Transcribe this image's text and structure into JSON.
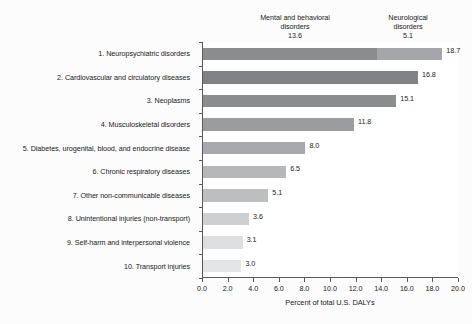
{
  "chart_data": {
    "type": "bar",
    "orientation": "horizontal",
    "title": "",
    "xlabel": "Percent of total U.S. DALYs",
    "ylabel": "",
    "xlim": [
      0.0,
      20.0
    ],
    "xticks": [
      "0.0",
      "2.0",
      "4.0",
      "6.0",
      "8.0",
      "10.0",
      "12.0",
      "14.0",
      "16.0",
      "18.0",
      "20.0"
    ],
    "xtick_values": [
      0,
      2,
      4,
      6,
      8,
      10,
      12,
      14,
      16,
      18,
      20
    ],
    "grid": false,
    "legend": "none",
    "categories": [
      "1. Neuropsychiatric disorders",
      "2. Cardiovascular and circulatory diseases",
      "3. Neoplasms",
      "4. Musculoskeletal disorders",
      "5. Diabetes, urogenital, blood, and endocrine disease",
      "6. Chronic respiratory diseases",
      "7. Other non-communicable diseases",
      "8. Unintentional injuries (non-transport)",
      "9. Self-harm and interpersonal violence",
      "10. Transport injuries"
    ],
    "values": [
      18.7,
      16.8,
      15.1,
      11.8,
      8.0,
      6.5,
      5.1,
      3.6,
      3.1,
      3.0
    ],
    "value_labels": [
      "18.7",
      "16.8",
      "15.1",
      "11.8",
      "8.0",
      "6.5",
      "5.1",
      "3.6",
      "3.1",
      "3.0"
    ],
    "bar_colors": [
      "#939598",
      "#808285",
      "#8a8c8e",
      "#9a9c9e",
      "#a7a9ac",
      "#b5b7b9",
      "#bcbec0",
      "#cdcfd1",
      "#dcdee0",
      "#e3e5e7"
    ],
    "segments": [
      {
        "category_index": 0,
        "parts": [
          {
            "name": "Mental and behavioral disorders",
            "value": 13.6,
            "color": "#8a8c8e"
          },
          {
            "name": "Neurological disorders",
            "value": 5.1,
            "color": "#a4a6a9"
          }
        ]
      }
    ],
    "annotations": [
      {
        "name": "mental-and-behavioral-disorders",
        "line1": "Mental and behavioral",
        "line2": "disorders",
        "value": "13.6"
      },
      {
        "name": "neurological-disorders",
        "line1": "Neurological",
        "line2": "disorders",
        "value": "5.1"
      }
    ]
  }
}
